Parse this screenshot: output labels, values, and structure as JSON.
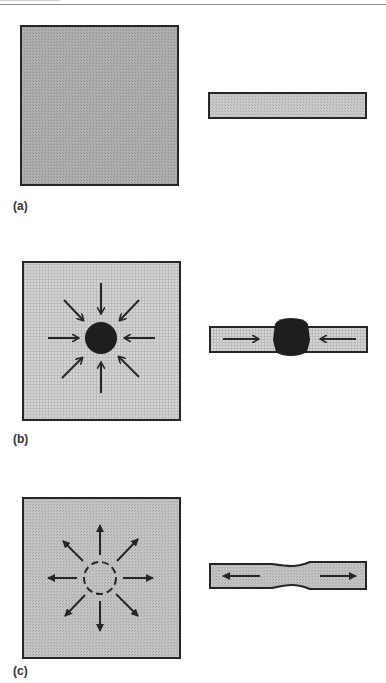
{
  "figure": {
    "panels": [
      {
        "id": "a",
        "label": "(a)",
        "description": "Plate with uniform stress; side view uniform strip",
        "plate_shade": "#a8a8a8",
        "strip_shade": "#c2c2c2"
      },
      {
        "id": "b",
        "label": "(b)",
        "description": "Inward radial arrows converge on dark inclusion; strip shows bulged dark center with opposing inward arrows",
        "plate_shade": "#cfcfcf",
        "strip_shade": "#d6d6d6",
        "inclusion_color": "#1e1e1e"
      },
      {
        "id": "c",
        "label": "(c)",
        "description": "Outward radial arrows from dashed circle; strip shows necking with outward arrows",
        "plate_shade": "#bdbdbd",
        "strip_shade": "#c8c8c8"
      }
    ],
    "colors": {
      "outline": "#262626",
      "arrow": "#262626",
      "background": "#ffffff"
    }
  }
}
